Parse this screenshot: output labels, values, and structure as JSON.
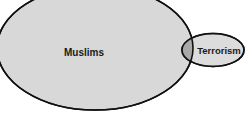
{
  "diagram": {
    "type": "venn",
    "sets": [
      {
        "label": "Muslims",
        "fill": "#d8d8d8",
        "stroke": "#111111"
      },
      {
        "label": "Terrorism",
        "fill": "#dcdcdc",
        "stroke": "#111111"
      }
    ],
    "overlap_fill": "#a9a9a9",
    "background": "#ffffff"
  }
}
